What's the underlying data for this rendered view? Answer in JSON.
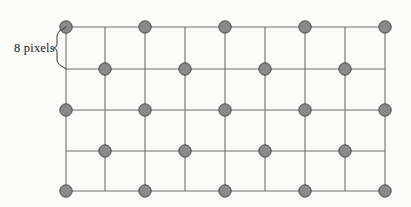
{
  "figure": {
    "name": "sampling-grid-diagram",
    "background_color": "#fbfbf9",
    "grid": {
      "line_color": "#6f6f6f",
      "line_width": 1.1,
      "vertical_lines_x": [
        66,
        105,
        145,
        185,
        225,
        265,
        305,
        345,
        385
      ],
      "horizontal_lines_y": [
        27,
        69,
        110,
        151,
        191
      ],
      "column_spacing_px": 40,
      "row_spacing_px": 41,
      "columns": 9,
      "rows": 5
    },
    "dots": {
      "fill_color": "#8a8a8a",
      "stroke_color": "#4a4a4a",
      "radius": 6.2,
      "pattern": "quincunx",
      "rows": [
        {
          "y": 27,
          "x": [
            66,
            145,
            225,
            305,
            385
          ]
        },
        {
          "y": 69,
          "x": [
            105,
            185,
            265,
            345
          ]
        },
        {
          "y": 110,
          "x": [
            66,
            145,
            225,
            305,
            385
          ]
        },
        {
          "y": 151,
          "x": [
            105,
            185,
            265,
            345
          ]
        },
        {
          "y": 191,
          "x": [
            66,
            145,
            225,
            305,
            385
          ]
        }
      ],
      "total_count": 23
    },
    "annotation": {
      "label": "8 pixels",
      "label_x": 14,
      "label_y": 41,
      "brace_color": "#4a4a4a",
      "brace_span_from_y": 27,
      "brace_span_to_y": 69,
      "brace_tip_x": 53
    }
  }
}
